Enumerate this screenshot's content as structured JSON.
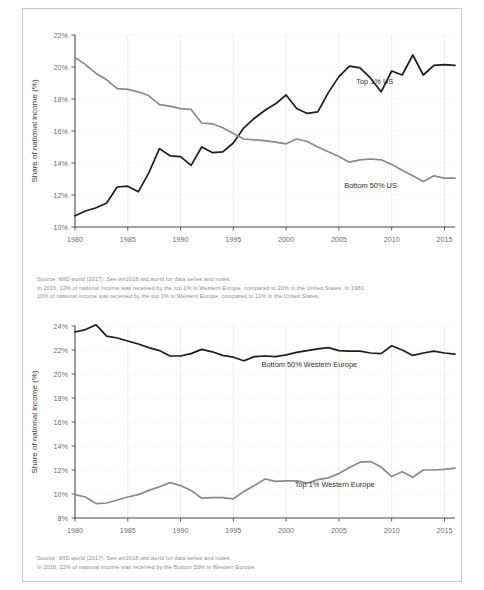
{
  "figures": [
    {
      "id": "us",
      "caption_lines": [
        "Source:  WID.world (2017). See wir2018.wid.world for data series and notes.",
        "In 2016, 12% of national income was received by the top 1% in Western Europe, compared to 20% in the United States. In 1980,",
        "10% of national income was received by the top 1% in Western Europe, compared to 11% in the United States."
      ]
    },
    {
      "id": "we",
      "caption_lines": [
        "Source:  WID.world (2017). See wir2018.wid.world for data series and notes.",
        "In 2016, 22% of national income was received by the Bottom 50% in Western Europe."
      ]
    }
  ],
  "chart_data": [
    {
      "type": "line",
      "title": "",
      "xlabel": "",
      "ylabel": "Share of national income (%)",
      "xlim": [
        1980,
        2016
      ],
      "ylim": [
        10,
        22
      ],
      "yticks": [
        10,
        12,
        14,
        16,
        18,
        20,
        22
      ],
      "ytick_labels": [
        "10%",
        "12%",
        "14%",
        "16%",
        "18%",
        "20%",
        "22%"
      ],
      "xticks": [
        1980,
        1985,
        1990,
        1995,
        2000,
        2005,
        2010,
        2015
      ],
      "xtick_labels": [
        "1980",
        "1985",
        "1990",
        "1995",
        "2000",
        "2005",
        "2010",
        "2015"
      ],
      "grid": true,
      "legend_position": "inline-annotation",
      "x": [
        1980,
        1981,
        1982,
        1983,
        1984,
        1985,
        1986,
        1987,
        1988,
        1989,
        1990,
        1991,
        1992,
        1993,
        1994,
        1995,
        1996,
        1997,
        1998,
        1999,
        2000,
        2001,
        2002,
        2003,
        2004,
        2005,
        2006,
        2007,
        2008,
        2009,
        2010,
        2011,
        2012,
        2013,
        2014,
        2015,
        2016
      ],
      "series": [
        {
          "name": "Top 1% US",
          "color": "#1d1d1d",
          "label_x": 2008.4,
          "label_y": 18.95,
          "values": [
            10.7,
            11.0,
            11.2,
            11.5,
            12.5,
            12.55,
            12.2,
            13.4,
            14.9,
            14.45,
            14.4,
            13.85,
            15.0,
            14.65,
            14.7,
            15.25,
            16.2,
            16.8,
            17.3,
            17.7,
            18.25,
            17.4,
            17.1,
            17.2,
            18.4,
            19.4,
            20.05,
            19.95,
            19.3,
            18.45,
            19.75,
            19.5,
            20.75,
            19.5,
            20.1,
            20.15,
            20.1
          ]
        },
        {
          "name": "Bottom 50% US",
          "color": "#8a8a8a",
          "label_x": 2008.0,
          "label_y": 12.45,
          "values": [
            20.6,
            20.15,
            19.6,
            19.2,
            18.65,
            18.6,
            18.45,
            18.2,
            17.65,
            17.55,
            17.4,
            17.35,
            16.5,
            16.45,
            16.2,
            15.85,
            15.5,
            15.45,
            15.4,
            15.3,
            15.2,
            15.5,
            15.35,
            15.0,
            14.7,
            14.4,
            14.05,
            14.2,
            14.25,
            14.2,
            13.9,
            13.55,
            13.2,
            12.85,
            13.2,
            13.05,
            13.05
          ]
        }
      ]
    },
    {
      "type": "line",
      "title": "",
      "xlabel": "",
      "ylabel": "Share of national income (%)",
      "xlim": [
        1980,
        2016
      ],
      "ylim": [
        8,
        24
      ],
      "yticks": [
        8,
        10,
        12,
        14,
        16,
        18,
        20,
        22,
        24
      ],
      "ytick_labels": [
        "8%",
        "10%",
        "12%",
        "14%",
        "16%",
        "18%",
        "20%",
        "22%",
        "24%"
      ],
      "xticks": [
        1980,
        1985,
        1990,
        1995,
        2000,
        2005,
        2010,
        2015
      ],
      "xtick_labels": [
        "1980",
        "1985",
        "1990",
        "1995",
        "2000",
        "2005",
        "2010",
        "2015"
      ],
      "grid": true,
      "legend_position": "inline-annotation",
      "x": [
        1980,
        1981,
        1982,
        1983,
        1984,
        1985,
        1986,
        1987,
        1988,
        1989,
        1990,
        1991,
        1992,
        1993,
        1994,
        1995,
        1996,
        1997,
        1998,
        1999,
        2000,
        2001,
        2002,
        2003,
        2004,
        2005,
        2006,
        2007,
        2008,
        2009,
        2010,
        2011,
        2012,
        2013,
        2014,
        2015,
        2016
      ],
      "series": [
        {
          "name": "Bottom 50% Western Europe",
          "color": "#1d1d1d",
          "label_x": 2002.2,
          "label_y": 20.55,
          "values": [
            23.5,
            23.7,
            24.1,
            23.15,
            23.0,
            22.75,
            22.5,
            22.2,
            21.95,
            21.5,
            21.5,
            21.7,
            22.05,
            21.85,
            21.55,
            21.4,
            21.1,
            21.45,
            21.5,
            21.45,
            21.6,
            21.8,
            21.95,
            22.1,
            22.2,
            21.95,
            21.9,
            21.9,
            21.75,
            21.7,
            22.35,
            22.0,
            21.55,
            21.75,
            21.9,
            21.75,
            21.65
          ]
        },
        {
          "name": "Top 1% Western Europe",
          "color": "#8a8a8a",
          "label_x": 2004.6,
          "label_y": 10.55,
          "values": [
            9.95,
            9.75,
            9.2,
            9.25,
            9.5,
            9.75,
            9.95,
            10.3,
            10.6,
            10.95,
            10.7,
            10.3,
            9.65,
            9.7,
            9.7,
            9.6,
            10.2,
            10.7,
            11.25,
            11.05,
            11.1,
            11.1,
            10.9,
            11.2,
            11.35,
            11.7,
            12.2,
            12.65,
            12.7,
            12.25,
            11.45,
            11.85,
            11.4,
            12.0,
            12.0,
            12.05,
            12.15
          ]
        }
      ]
    }
  ]
}
